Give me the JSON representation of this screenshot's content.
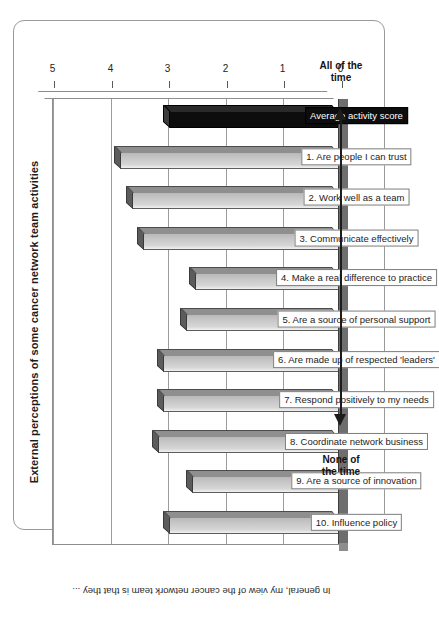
{
  "figure": {
    "title": "External perceptions of some cancer network team activities",
    "footer_caption": "In general, my view of the cancer network team is that they ...",
    "scale_low_label": "None of\nthe time",
    "scale_high_label": "All of the\ntime",
    "accent_color": "#0d0d0d",
    "bar_color": "#c9c9c9",
    "grid_color": "#9c9c9c"
  },
  "scale_captions": {
    "low_line1": "None of",
    "low_line2": "the time",
    "high_line1": "All of the",
    "high_line2": "time"
  },
  "chart_data": {
    "type": "bar",
    "title": "External perceptions of some cancer network team activities",
    "xlabel": "In general, my view of the cancer network team is that they ...",
    "ylabel": "",
    "ylim": [
      0,
      5
    ],
    "yticks": [
      0,
      1,
      2,
      3,
      4,
      5
    ],
    "ytick_labels": [
      "0",
      "1",
      "2",
      "3",
      "4",
      "5"
    ],
    "grid": true,
    "orientation": "rotated-90",
    "legend": "none",
    "categories": [
      "10. Influence policy",
      "9. Are a source of innovation",
      "8. Coordinate network business",
      "7. Respond positively to my needs",
      "6. Are made up of respected 'leaders'",
      "5. Are a source of personal support",
      "4. Make a real difference to practice",
      "3. Communicate effectively",
      "2. Work well as a team",
      "1. Are people I can trust",
      "Average activity score"
    ],
    "values": [
      2.95,
      2.55,
      3.15,
      3.05,
      3.05,
      2.65,
      2.5,
      3.4,
      3.6,
      3.8,
      2.95
    ],
    "highlight_index": 10,
    "scale_low": "None of the time",
    "scale_high": "All of the time"
  }
}
